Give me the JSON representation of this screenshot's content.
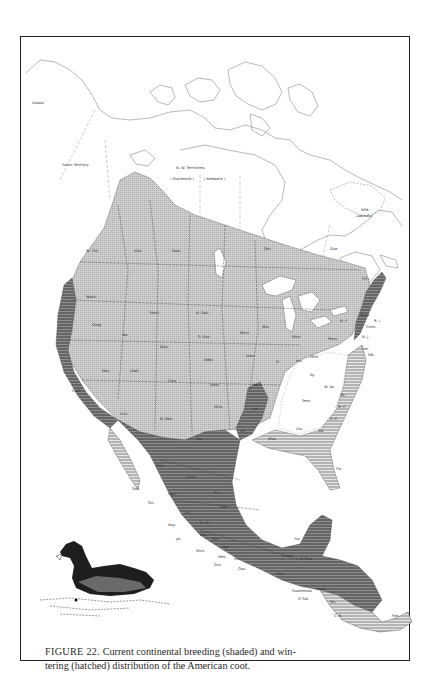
{
  "figure": {
    "number_label": "FIGURE 22.",
    "caption": "Current continental breeding (shaded) and wintering (hatched) distribution of the American coot.",
    "caption_line1": "Current continental breeding (shaded) and win-",
    "caption_line2": "tering (hatched) distribution of the American coot."
  },
  "legend": {
    "breeding": {
      "label": "breeding (shaded)",
      "color": "#c4c4c4"
    },
    "wintering": {
      "label": "wintering (hatched)",
      "color": "#8a8a8a"
    },
    "overlap_color": "#6f6f6f"
  },
  "map": {
    "region_labels": {
      "alaska": "Alaska",
      "yukon": "Yukon Territory",
      "nwt": "N. W. Territories",
      "mackenzie": "( Mackenzie )",
      "keewatin": "( Keewatin )",
      "nfld": "Nfld. Labrador",
      "bc": "Br. Col.",
      "alta": "Alta.",
      "sask": "Sask.",
      "manit": "Manit.",
      "ont": "Ont.",
      "que": "Que.",
      "pei": "P.E.I.",
      "wash": "Wash.",
      "oreg": "Oreg.",
      "ida": "Ida.",
      "mont": "Mont.",
      "wyo": "Wyo.",
      "nev": "Nev.",
      "utah": "Utah",
      "colo": "Colo.",
      "calif": "Calif.",
      "ariz": "Ariz.",
      "nmex": "N. Mex.",
      "ndak": "N. Dak.",
      "sdak": "S. Dak.",
      "nebr": "Nebr.",
      "kans": "Kans.",
      "okla": "Okla.",
      "tex": "Tex.",
      "minn": "Minn.",
      "iowa": "Iowa",
      "mo": "Mo.",
      "ark": "Ark.",
      "wis": "Wis.",
      "ill": "Ill.",
      "mich": "Mich.",
      "ind": "Ind.",
      "ohio": "Ohio",
      "ky": "Ky.",
      "tenn": "Tenn.",
      "ala": "Ala.",
      "ga": "Ga.",
      "fla": "Fla.",
      "sc": "S. C.",
      "nc": "N. C.",
      "va": "Va.",
      "wva": "W. Va.",
      "penn": "Penn.",
      "ny": "N. Y.",
      "nj": "N. J.",
      "del": "Del.",
      "md": "Md.",
      "mass": "Mass.",
      "ri": "R. I.",
      "conn": "Conn.",
      "vt": "Vt.",
      "me": "Me.",
      "nh": "N. H.",
      "la": "La.",
      "miss": "Miss.",
      "chih": "Chih.",
      "son": "Son.",
      "coah": "Coah.",
      "nl": "N. L.",
      "dgo": "Dgo.",
      "tam": "Tam.",
      "sin": "Sin.",
      "zac": "Zac.",
      "slp": "S.L.P.",
      "nay": "Nay.",
      "jal": "Jal.",
      "gto": "Gto.",
      "qro": "Qro.",
      "hgo": "Hgo.",
      "mich_mx": "Mich.",
      "mex": "Mex.",
      "ver": "Ver.",
      "gro": "Gro.",
      "oax": "Oax.",
      "chis": "Chis.",
      "camp": "Camp.",
      "yuc": "Yuc.",
      "qroo": "Q. Roo",
      "guat": "Guatemala",
      "hond": "Hond.",
      "elsal": "El Sal.",
      "nic": "Nic.",
      "cr": "C. R.",
      "pan": "Pan."
    }
  }
}
